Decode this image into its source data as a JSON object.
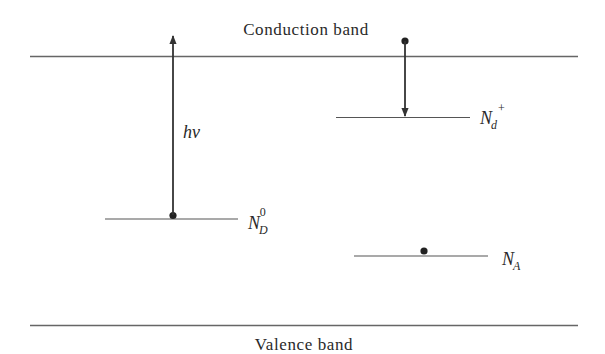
{
  "diagram": {
    "type": "energy-band-diagram",
    "bands": {
      "conduction": {
        "label": "Conduction band"
      },
      "valence": {
        "label": "Valence band"
      }
    },
    "levels": [
      {
        "id": "donor-neutral",
        "label_main": "N",
        "label_sub": "D",
        "label_sup": "0",
        "has_electron": true
      },
      {
        "id": "donor-ionized",
        "label_main": "N",
        "label_sub": "d",
        "label_sup": "+",
        "has_electron": false
      },
      {
        "id": "acceptor",
        "label_main": "N",
        "label_sub": "A",
        "label_sup": "",
        "has_electron": true
      }
    ],
    "transitions": [
      {
        "id": "photon-excitation",
        "from": "donor-neutral",
        "to": "conduction",
        "direction": "up",
        "label": "hν"
      },
      {
        "id": "electron-capture",
        "from": "conduction",
        "to": "donor-ionized",
        "direction": "down",
        "label": ""
      }
    ],
    "colors": {
      "line": "#555555",
      "arrow": "#333333",
      "text": "#2a2a2a",
      "dot": "#222222"
    }
  }
}
